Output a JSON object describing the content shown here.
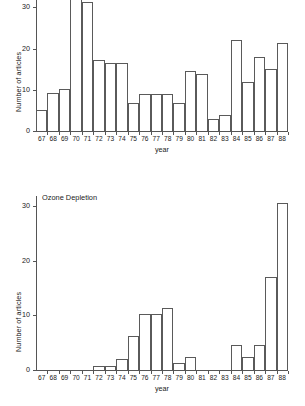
{
  "figure": {
    "background": "#ffffff",
    "line_color": "#5a5a5a",
    "text_color": "#1a1a1a"
  },
  "chart_data": [
    {
      "id": "articles-by-year-top",
      "type": "bar",
      "title": "",
      "xlabel": "year",
      "ylabel": "Number of articles",
      "categories": [
        "67",
        "68",
        "69",
        "70",
        "71",
        "72",
        "73",
        "74",
        "75",
        "76",
        "77",
        "78",
        "79",
        "80",
        "81",
        "82",
        "83",
        "84",
        "85",
        "86",
        "87",
        "88"
      ],
      "values": [
        5,
        9.3,
        10.3,
        33,
        31.3,
        17.3,
        16.5,
        16.5,
        6.7,
        9,
        9,
        9,
        6.9,
        14.5,
        13.7,
        3,
        4,
        22,
        12,
        18,
        15,
        21.3
      ],
      "yticks": [
        0,
        10,
        20,
        30
      ],
      "ytick_labels": [
        "0",
        "10",
        "20",
        "30"
      ],
      "ylim": [
        0,
        32
      ],
      "grid": false,
      "legend": "none",
      "clipped_bars": [
        "70"
      ],
      "note": ""
    },
    {
      "id": "articles-by-year-ozone",
      "type": "bar",
      "title": "Ozone Depletion",
      "xlabel": "year",
      "ylabel": "Number of articles",
      "categories": [
        "67",
        "68",
        "69",
        "70",
        "71",
        "72",
        "73",
        "74",
        "75",
        "76",
        "77",
        "78",
        "79",
        "80",
        "81",
        "82",
        "83",
        "84",
        "85",
        "86",
        "87",
        "88"
      ],
      "values": [
        0,
        0,
        0,
        0,
        0,
        0.7,
        0.7,
        2,
        6.3,
        10.3,
        10.3,
        11.3,
        1.3,
        2.3,
        0,
        0,
        0,
        4.6,
        2.4,
        4.6,
        17,
        30.5
      ],
      "yticks": [
        0,
        10,
        20,
        30
      ],
      "ytick_labels": [
        "0",
        "10",
        "20",
        "30"
      ],
      "ylim": [
        0,
        31.5
      ],
      "grid": false,
      "legend": "none",
      "note": "Ozone Depletion"
    }
  ]
}
